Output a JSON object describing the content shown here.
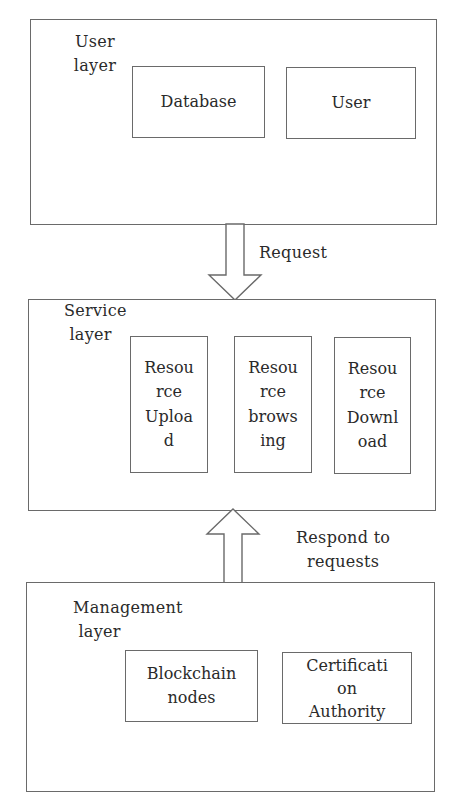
{
  "diagram": {
    "type": "layered-architecture",
    "layers": [
      {
        "id": "user-layer",
        "label": "User\nlayer",
        "components": [
          {
            "id": "database",
            "label": "Database"
          },
          {
            "id": "user",
            "label": "User"
          }
        ]
      },
      {
        "id": "service-layer",
        "label": "Service\n layer",
        "components": [
          {
            "id": "resource-upload",
            "label": "Resou\nrce\nUploa\nd"
          },
          {
            "id": "resource-browsing",
            "label": "Resou\nrce\nbrows\ning"
          },
          {
            "id": "resource-download",
            "label": "Resou\nrce\nDownl\noad"
          }
        ]
      },
      {
        "id": "management-layer",
        "label": "Management\n layer",
        "components": [
          {
            "id": "blockchain-nodes",
            "label": "Blockchain\nnodes"
          },
          {
            "id": "certification-authority",
            "label": "Certificati\non\nAuthority"
          }
        ]
      }
    ],
    "edges": [
      {
        "from": "user-layer",
        "to": "service-layer",
        "direction": "down",
        "label": "Request"
      },
      {
        "from": "management-layer",
        "to": "service-layer",
        "direction": "up",
        "label": "Respond to\nrequests"
      }
    ],
    "colors": {
      "line": "#6a6a6a",
      "text": "#2a2a2a",
      "background": "#ffffff"
    }
  }
}
